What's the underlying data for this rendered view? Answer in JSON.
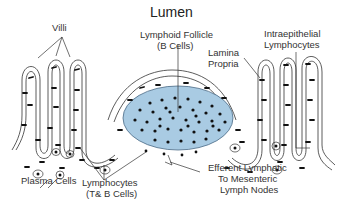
{
  "diagram": {
    "title": "Lumen",
    "labels": {
      "villi": "Villi",
      "follicle_line1": "Lymphoid Follicle",
      "follicle_line2": "(B Cells)",
      "lamina_line1": "Lamina",
      "lamina_line2": "Propria",
      "iel_line1": "Intraepithelial",
      "iel_line2": "Lymphocytes",
      "plasma": "Plasma Cells",
      "lympho_line1": "Lymphocytes",
      "lympho_line2": "(T& B Cells)",
      "efferent_line1": "Efferent Lymphatic",
      "efferent_line2": "To Mesenteric",
      "efferent_line3": "Lymph Nodes"
    },
    "colors": {
      "follicle_fill": "#a9cbe3",
      "follicle_stroke": "#4a6a85",
      "line": "#333333",
      "dot": "#111111"
    }
  }
}
